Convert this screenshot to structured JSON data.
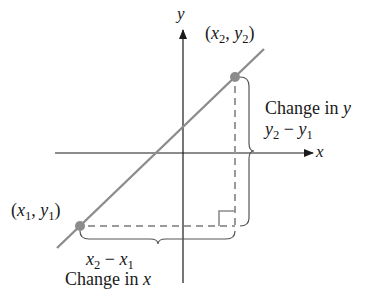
{
  "diagram": {
    "axes": {
      "x_label": "x",
      "y_label": "y"
    },
    "points": [
      {
        "id": "p1",
        "label_var_x": "x",
        "label_sub_x": "1",
        "label_var_y": "y",
        "label_sub_y": "1",
        "px": 80,
        "py": 226
      },
      {
        "id": "p2",
        "label_var_x": "x",
        "label_sub_x": "2",
        "label_var_y": "y",
        "label_sub_y": "2",
        "px": 235,
        "py": 77
      }
    ],
    "change_in_y": {
      "caption": "Change in y",
      "caption_text": "Change in ",
      "caption_var": "y",
      "expr_a": "y",
      "expr_a_sub": "2",
      "minus": " − ",
      "expr_b": "y",
      "expr_b_sub": "1"
    },
    "change_in_x": {
      "caption": "Change in x",
      "caption_text": "Change in ",
      "caption_var": "x",
      "expr_a": "x",
      "expr_a_sub": "2",
      "minus": " − ",
      "expr_b": "x",
      "expr_b_sub": "1"
    },
    "colors": {
      "line": "#8c8c8c",
      "point": "#8c8c8c",
      "axis": "#1a1a1a",
      "dashed": "#9a9a9a",
      "brace": "#555555"
    }
  }
}
